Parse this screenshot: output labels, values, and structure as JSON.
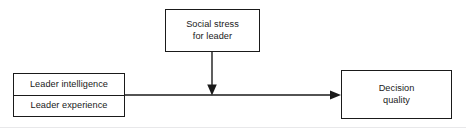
{
  "diagram": {
    "type": "path-model",
    "background_color": "#ffffff",
    "line_color": "#1a1a1a",
    "nodes": [
      {
        "id": "social_stress",
        "name": "social-stress-box",
        "lines": [
          "Social stress",
          "for leader"
        ],
        "role": "moderator"
      },
      {
        "id": "predictors",
        "name": "predictors-box",
        "cells": [
          {
            "id": "leader_intelligence",
            "label": "Leader intelligence"
          },
          {
            "id": "leader_experience",
            "label": "Leader experience"
          }
        ],
        "role": "predictor"
      },
      {
        "id": "decision_quality",
        "name": "decision-quality-box",
        "lines": [
          "Decision",
          "quality"
        ],
        "role": "outcome"
      }
    ],
    "edges": [
      {
        "id": "predictors_to_outcome",
        "from": "predictors",
        "to": "decision_quality",
        "orientation": "horizontal",
        "arrowhead": "solid-triangle"
      },
      {
        "id": "stress_moderates_path",
        "from": "social_stress",
        "to": "predictors_to_outcome",
        "orientation": "vertical",
        "arrowhead": "solid-triangle"
      }
    ],
    "rule": {
      "name": "bottom-rule",
      "color": "#e8e8ea"
    }
  }
}
